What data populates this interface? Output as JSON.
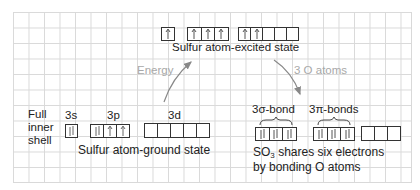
{
  "excited_state": {
    "label": "Sulfur atom-excited state",
    "orbitals": {
      "s": [
        "up"
      ],
      "p": [
        "up",
        "up",
        "up"
      ],
      "d": [
        "up",
        "up",
        "",
        "",
        ""
      ]
    }
  },
  "ground_state": {
    "label": "Sulfur atom-ground state",
    "side_label_lines": [
      "Full",
      "inner",
      "shell"
    ],
    "sublevel_labels": {
      "s": "3s",
      "p": "3p",
      "d": "3d"
    },
    "orbitals": {
      "s": [
        "pair"
      ],
      "p": [
        "pair",
        "up",
        "up"
      ],
      "d": [
        "",
        "",
        "",
        "",
        ""
      ]
    }
  },
  "bonded_state": {
    "sigma_label": "3σ-bond",
    "pi_label": "3π-bonds",
    "orbitals": {
      "sigma": [
        "pair",
        "pair",
        "pair"
      ],
      "pi": [
        "pair",
        "pair",
        "pair"
      ],
      "empty": [
        "",
        "",
        ""
      ]
    },
    "caption_line1_prefix": "SO",
    "caption_line1_sub": "3",
    "caption_line1_suffix": " shares six electrons",
    "caption_line2": "by bonding O atoms"
  },
  "arrows": {
    "energy_label": "Energy",
    "oxygen_label": "3 O atoms",
    "color": "#888888"
  },
  "colors": {
    "grid": "#d9d9d9",
    "text": "#222222",
    "muted_text": "#a8a8a8",
    "box_border": "#333333"
  }
}
